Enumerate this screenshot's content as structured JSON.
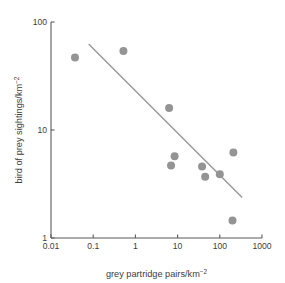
{
  "chart_data": {
    "type": "scatter",
    "title": "",
    "xlabel": "grey partridge pairs/km",
    "xlabel_sup": "−2",
    "ylabel": "bird of prey sightings/km",
    "ylabel_sup": "−2",
    "xscale": "log",
    "yscale": "log",
    "xlim": [
      0.01,
      1000
    ],
    "ylim": [
      1,
      100
    ],
    "grid": false,
    "legend": null,
    "xticks": [
      "0.01",
      "0.1",
      "1",
      "10",
      "100",
      "1000"
    ],
    "xtick_values": [
      0.01,
      0.1,
      1,
      10,
      100,
      1000
    ],
    "yticks": [
      "1",
      "10",
      "100"
    ],
    "ytick_values": [
      1,
      10,
      100
    ],
    "marker_color": "#949494",
    "marker_radius": 4,
    "line_color": "#9a9a9a",
    "axis_color": "#5a5a5a",
    "points": [
      {
        "x": 0.037,
        "y": 47
      },
      {
        "x": 0.52,
        "y": 54
      },
      {
        "x": 6.3,
        "y": 16
      },
      {
        "x": 8.5,
        "y": 5.7
      },
      {
        "x": 7.0,
        "y": 4.7
      },
      {
        "x": 38,
        "y": 4.6
      },
      {
        "x": 45,
        "y": 3.7
      },
      {
        "x": 100,
        "y": 3.9
      },
      {
        "x": 210,
        "y": 6.2
      },
      {
        "x": 200,
        "y": 1.45
      }
    ],
    "trendline": {
      "x_start": 0.08,
      "y_start": 62,
      "x_end": 330,
      "y_end": 2.4
    }
  },
  "plot_geometry": {
    "left_px": 51,
    "right_px": 262,
    "top_px": 22,
    "bottom_px": 238
  }
}
